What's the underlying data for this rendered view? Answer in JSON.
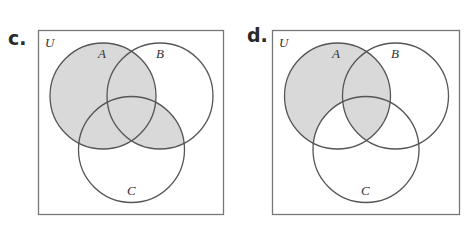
{
  "colors": {
    "shade": "#d9d9d9",
    "stroke": "#555555",
    "box": "#777777",
    "background": "#ffffff"
  },
  "panels": [
    {
      "label": "c.",
      "universe_label": "U",
      "sets": [
        {
          "name": "A"
        },
        {
          "name": "B"
        },
        {
          "name": "C"
        }
      ],
      "shaded_expression": "A ∪ (B ∩ C)",
      "shaded_regions": [
        "A only",
        "A∩B only",
        "A∩C only",
        "A∩B∩C",
        "B∩C only"
      ]
    },
    {
      "label": "d.",
      "universe_label": "U",
      "sets": [
        {
          "name": "A"
        },
        {
          "name": "B"
        },
        {
          "name": "C"
        }
      ],
      "shaded_expression": "(A − C) ∪ (A ∩ B)",
      "shaded_regions": [
        "A only",
        "A∩B only",
        "A∩B∩C"
      ]
    }
  ]
}
